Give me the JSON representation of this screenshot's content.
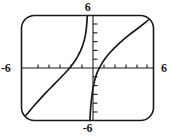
{
  "figure": {
    "kind": "graphing-calculator-plot",
    "frame_style": "rounded-rectangle",
    "background_color": "#ffffff",
    "ink_color": "#1a1a1a"
  },
  "labels": {
    "top": "6",
    "bottom": "-6",
    "left": "-6",
    "right": "6"
  },
  "chart_data": {
    "type": "line",
    "title": "",
    "xlabel": "",
    "ylabel": "",
    "xlim": [
      -6,
      6
    ],
    "ylim": [
      -6,
      6
    ],
    "grid": false,
    "legend": false,
    "axes": {
      "x_axis_visible": true,
      "y_axis_visible": true,
      "x_tick_labels": [
        "-6",
        "6"
      ],
      "y_tick_labels": [
        "-6",
        "6"
      ],
      "x_tick_values": [
        -5,
        -4,
        -3,
        -2,
        -1,
        1,
        2,
        3,
        4,
        5
      ],
      "y_tick_values": [
        -5,
        -4,
        -3,
        -2,
        -1,
        1,
        2,
        3,
        4,
        5
      ],
      "tick_spacing": 1
    },
    "asymptotes": {
      "vertical": [
        0.1
      ]
    },
    "series": [
      {
        "name": "left-branch",
        "x": [
          -6.0,
          -5.5,
          -5.0,
          -4.5,
          -4.0,
          -3.5,
          -3.0,
          -2.6,
          -2.2,
          -1.9,
          -1.6,
          -1.3,
          -1.05,
          -0.85,
          -0.65,
          -0.5,
          -0.38,
          -0.28,
          -0.2,
          -0.14,
          -0.09,
          -0.05,
          -0.02
        ],
        "y": [
          -6.0,
          -5.25,
          -4.5,
          -3.8,
          -3.1,
          -2.45,
          -1.8,
          -1.3,
          -0.78,
          -0.38,
          0.05,
          0.55,
          1.0,
          1.45,
          1.95,
          2.4,
          2.85,
          3.3,
          3.75,
          4.2,
          4.75,
          5.35,
          6.0
        ]
      },
      {
        "name": "right-branch",
        "x": [
          0.22,
          0.25,
          0.29,
          0.34,
          0.4,
          0.47,
          0.56,
          0.66,
          0.78,
          0.92,
          1.1,
          1.35,
          1.65,
          2.0,
          2.45,
          2.95,
          3.5,
          4.1,
          4.75,
          5.4,
          6.0
        ],
        "y": [
          -6.0,
          -5.3,
          -4.6,
          -3.9,
          -3.2,
          -2.55,
          -1.95,
          -1.4,
          -0.9,
          -0.42,
          0.05,
          0.6,
          1.15,
          1.7,
          2.3,
          2.9,
          3.5,
          4.1,
          4.7,
          5.35,
          6.0
        ]
      }
    ]
  }
}
